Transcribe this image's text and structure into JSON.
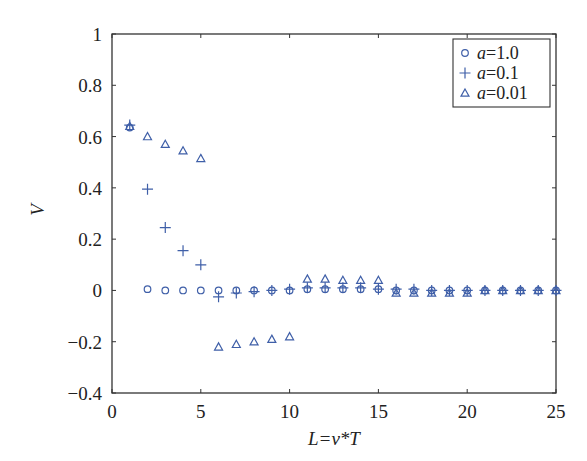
{
  "chart_data": {
    "type": "scatter",
    "title": "",
    "xlabel": "L=v*T",
    "ylabel": "V",
    "xlim": [
      0,
      25
    ],
    "ylim": [
      -0.4,
      1
    ],
    "xticks": [
      0,
      5,
      10,
      15,
      20,
      25
    ],
    "xtick_labels": [
      "0",
      "5",
      "10",
      "15",
      "20",
      "25"
    ],
    "yticks": [
      -0.4,
      -0.2,
      0,
      0.2,
      0.4,
      0.6,
      0.8,
      1
    ],
    "ytick_labels": [
      "−0.4",
      "−0.2",
      "0",
      "0.2",
      "0.4",
      "0.6",
      "0.8",
      "1"
    ],
    "grid": false,
    "legend_position": "top-right",
    "marker_color": "#3f5fa8",
    "series": [
      {
        "name": "a=1.0",
        "legend_label": "a=1.0",
        "marker": "circle",
        "x": [
          1,
          2,
          3,
          4,
          5,
          6,
          7,
          8,
          9,
          10,
          11,
          12,
          13,
          14,
          15,
          16,
          17,
          18,
          19,
          20,
          21,
          22,
          23,
          24,
          25
        ],
        "y": [
          0.635,
          0.005,
          0.0,
          0.0,
          0.0,
          0.0,
          0.0,
          0.0,
          0.0,
          0.0,
          0.005,
          0.005,
          0.005,
          0.005,
          0.005,
          0.0,
          0.0,
          0.0,
          0.0,
          0.0,
          0.0,
          0.0,
          0.0,
          0.0,
          0.0
        ]
      },
      {
        "name": "a=0.1",
        "legend_label": "a=0.1",
        "marker": "plus",
        "x": [
          1,
          2,
          3,
          4,
          5,
          6,
          7,
          8,
          9,
          10,
          11,
          12,
          13,
          14,
          15,
          16,
          17,
          18,
          19,
          20,
          21,
          22,
          23,
          24,
          25
        ],
        "y": [
          0.645,
          0.395,
          0.245,
          0.155,
          0.1,
          -0.025,
          -0.01,
          -0.005,
          0.0,
          0.005,
          0.01,
          0.01,
          0.01,
          0.01,
          0.005,
          0.005,
          0.005,
          0.0,
          0.0,
          0.0,
          0.0,
          0.0,
          0.0,
          0.0,
          0.0
        ]
      },
      {
        "name": "a=0.01",
        "legend_label": "a=0.01",
        "marker": "triangle",
        "x": [
          1,
          2,
          3,
          4,
          5,
          6,
          7,
          8,
          9,
          10,
          11,
          12,
          13,
          14,
          15,
          16,
          17,
          18,
          19,
          20,
          21,
          22,
          23,
          24,
          25
        ],
        "y": [
          0.64,
          0.6,
          0.57,
          0.545,
          0.515,
          -0.22,
          -0.21,
          -0.2,
          -0.19,
          -0.18,
          0.045,
          0.045,
          0.04,
          0.04,
          0.04,
          -0.01,
          -0.01,
          -0.01,
          -0.01,
          -0.01,
          0.0,
          0.0,
          0.0,
          0.0,
          0.0
        ]
      }
    ]
  }
}
